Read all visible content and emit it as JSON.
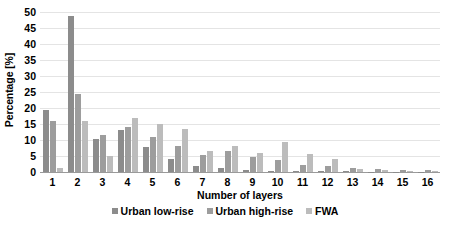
{
  "chart_data": {
    "type": "bar",
    "title": "",
    "xlabel": "Number of layers",
    "ylabel": "Percentage [%]",
    "categories": [
      "1",
      "2",
      "3",
      "4",
      "5",
      "6",
      "7",
      "8",
      "9",
      "10",
      "11",
      "12",
      "13",
      "14",
      "15",
      "16"
    ],
    "series": [
      {
        "name": "Urban low-rise",
        "color": "#8c8c8c",
        "values": [
          19.3,
          48.8,
          10.2,
          13.0,
          7.8,
          4.0,
          2.0,
          1.2,
          0.6,
          0.4,
          0.3,
          0.2,
          0.2,
          0.1,
          0.1,
          0.1
        ]
      },
      {
        "name": "Urban high-rise",
        "color": "#9d9d9d",
        "values": [
          15.8,
          24.5,
          11.6,
          14.2,
          11.0,
          8.0,
          5.2,
          6.6,
          4.6,
          3.6,
          2.3,
          1.8,
          1.4,
          0.9,
          0.7,
          0.6
        ]
      },
      {
        "name": "FWA",
        "color": "#bcbcbc",
        "values": [
          1.3,
          15.8,
          5.0,
          17.0,
          15.0,
          13.5,
          6.5,
          8.0,
          6.0,
          9.5,
          5.5,
          4.0,
          1.0,
          0.6,
          0.4,
          0.3
        ]
      }
    ],
    "ylim": [
      0,
      50
    ],
    "yticks": [
      0,
      5,
      10,
      15,
      20,
      25,
      30,
      35,
      40,
      45,
      50
    ],
    "grid": true,
    "legend_position": "bottom"
  },
  "legend": {
    "items": [
      {
        "label": "Urban low-rise"
      },
      {
        "label": "Urban high-rise"
      },
      {
        "label": "FWA"
      }
    ]
  }
}
